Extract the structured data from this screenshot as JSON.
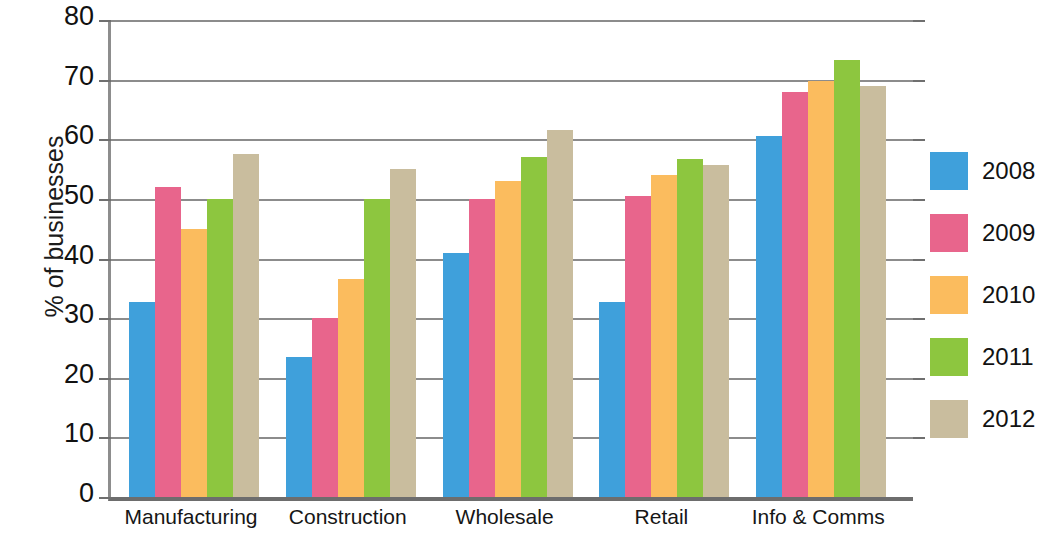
{
  "chart_data": {
    "type": "bar",
    "title": "",
    "xlabel": "",
    "ylabel": "% of businesses",
    "ylim": [
      0,
      80
    ],
    "ytick_step": 10,
    "yticks": [
      "80",
      "70",
      "60",
      "50",
      "40",
      "30",
      "20",
      "10",
      "0"
    ],
    "grid": true,
    "legend_position": "right",
    "categories": [
      "Manufacturing",
      "Construction",
      "Wholesale",
      "Retail",
      "Info & Comms"
    ],
    "series": [
      {
        "name": "2008",
        "color": "#3fa0db",
        "values": [
          32.7,
          23.5,
          41.0,
          32.7,
          60.5
        ]
      },
      {
        "name": "2009",
        "color": "#e8658c",
        "values": [
          52.0,
          30.0,
          50.0,
          50.5,
          68.0
        ]
      },
      {
        "name": "2010",
        "color": "#fbbc5e",
        "values": [
          45.0,
          36.5,
          53.0,
          54.0,
          69.7
        ]
      },
      {
        "name": "2011",
        "color": "#8dc63f",
        "values": [
          50.0,
          50.0,
          57.0,
          56.7,
          73.3
        ]
      },
      {
        "name": "2012",
        "color": "#c9bd9e",
        "values": [
          57.5,
          55.0,
          61.5,
          55.7,
          69.0
        ]
      }
    ]
  }
}
